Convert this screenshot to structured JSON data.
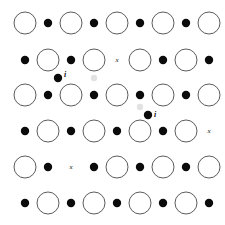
{
  "figure": {
    "background_color": "#ffffff",
    "width": 225,
    "height": 225
  },
  "legend_semantics": {
    "anion_name": "large open circle",
    "cation_name": "small filled dot",
    "vacancy_name": "x",
    "interstitial_name": "i"
  },
  "colors": {
    "circle_stroke": "#4a4a4a",
    "circle_fill": "#ffffff",
    "dot_fill": "#0b0b0b",
    "label_color": "#111111",
    "ghost_color": "#e2e2e2"
  },
  "geometry": {
    "circle_radius": 11,
    "dot_radius": 4.2,
    "interstitial_radius": 4.2,
    "ghost_radius": 3.2,
    "column_spacing": 23,
    "row_spacing": 36
  },
  "chart_data": {
    "type": "scatter",
    "xlabel": "",
    "ylabel": "",
    "grid": false,
    "legend_position": "none",
    "xlim": [
      0,
      225
    ],
    "ylim": [
      225,
      0
    ],
    "rows": [
      {
        "index": 1,
        "y": 23,
        "starts_with": "circle"
      },
      {
        "index": 2,
        "y": 60,
        "starts_with": "dot"
      },
      {
        "index": 3,
        "y": 95,
        "starts_with": "circle"
      },
      {
        "index": 4,
        "y": 131,
        "starts_with": "dot"
      },
      {
        "index": 5,
        "y": 167,
        "starts_with": "circle"
      },
      {
        "index": 6,
        "y": 203,
        "starts_with": "dot"
      }
    ],
    "series": [
      {
        "name": "anion (large open circle)",
        "marker": "open-circle",
        "points": [
          {
            "x": 25,
            "y": 23
          },
          {
            "x": 71,
            "y": 23
          },
          {
            "x": 117,
            "y": 23
          },
          {
            "x": 163,
            "y": 23
          },
          {
            "x": 209,
            "y": 23
          },
          {
            "x": 48,
            "y": 60
          },
          {
            "x": 94,
            "y": 60
          },
          {
            "x": 140,
            "y": 60
          },
          {
            "x": 186,
            "y": 60
          },
          {
            "x": 25,
            "y": 95
          },
          {
            "x": 71,
            "y": 95
          },
          {
            "x": 117,
            "y": 95
          },
          {
            "x": 163,
            "y": 95
          },
          {
            "x": 209,
            "y": 95
          },
          {
            "x": 48,
            "y": 131
          },
          {
            "x": 94,
            "y": 131
          },
          {
            "x": 140,
            "y": 131
          },
          {
            "x": 186,
            "y": 131
          },
          {
            "x": 25,
            "y": 167
          },
          {
            "x": 117,
            "y": 167
          },
          {
            "x": 163,
            "y": 167
          },
          {
            "x": 209,
            "y": 167
          },
          {
            "x": 48,
            "y": 203
          },
          {
            "x": 94,
            "y": 203
          },
          {
            "x": 140,
            "y": 203
          },
          {
            "x": 186,
            "y": 203
          }
        ]
      },
      {
        "name": "cation (small filled dot)",
        "marker": "filled-dot",
        "points": [
          {
            "x": 48,
            "y": 23
          },
          {
            "x": 94,
            "y": 23
          },
          {
            "x": 140,
            "y": 23
          },
          {
            "x": 186,
            "y": 23
          },
          {
            "x": 25,
            "y": 60
          },
          {
            "x": 71,
            "y": 60
          },
          {
            "x": 163,
            "y": 60
          },
          {
            "x": 209,
            "y": 60
          },
          {
            "x": 48,
            "y": 95
          },
          {
            "x": 94,
            "y": 95
          },
          {
            "x": 140,
            "y": 95
          },
          {
            "x": 186,
            "y": 95
          },
          {
            "x": 25,
            "y": 131
          },
          {
            "x": 71,
            "y": 131
          },
          {
            "x": 117,
            "y": 131
          },
          {
            "x": 163,
            "y": 131
          },
          {
            "x": 48,
            "y": 167
          },
          {
            "x": 94,
            "y": 167
          },
          {
            "x": 140,
            "y": 167
          },
          {
            "x": 186,
            "y": 167
          },
          {
            "x": 25,
            "y": 203
          },
          {
            "x": 71,
            "y": 203
          },
          {
            "x": 117,
            "y": 203
          },
          {
            "x": 163,
            "y": 203
          },
          {
            "x": 209,
            "y": 203
          }
        ]
      },
      {
        "name": "interstitial (filled dot labelled i)",
        "marker": "filled-dot-labelled",
        "points": [
          {
            "x": 58,
            "y": 78,
            "label": "i",
            "label_dx": 6,
            "label_dy": -3
          },
          {
            "x": 148,
            "y": 115,
            "label": "i",
            "label_dx": 6,
            "label_dy": 0
          }
        ]
      },
      {
        "name": "vacancy (site marked x)",
        "marker": "x-mark",
        "points": [
          {
            "x": 117,
            "y": 60,
            "label": "x",
            "vacant_site": "cation"
          },
          {
            "x": 209,
            "y": 131,
            "label": "x",
            "vacant_site": "anion"
          },
          {
            "x": 71,
            "y": 167,
            "label": "x",
            "vacant_site": "anion"
          }
        ]
      },
      {
        "name": "faint ghost mark",
        "marker": "ghost",
        "points": [
          {
            "x": 94,
            "y": 78
          },
          {
            "x": 140,
            "y": 107
          }
        ]
      }
    ]
  }
}
